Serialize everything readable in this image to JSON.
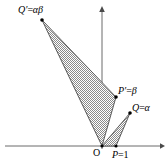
{
  "figure": {
    "background_color": "#ffffff",
    "stroke_color": "#555555",
    "axis_color": "#666666",
    "hatch_color": "#808080",
    "point_color": "#000000"
  },
  "axes": {
    "x_axis": {
      "name": "real-axis",
      "y": 146,
      "x_start": 5,
      "x_end": 162,
      "arrow": "right"
    },
    "y_axis": {
      "name": "imaginary-axis",
      "x": 102,
      "y_start": 148,
      "y_end": 8,
      "arrow": "up"
    }
  },
  "points": {
    "origin": {
      "label": "O",
      "x": 102,
      "y": 146
    },
    "p": {
      "label_name": "P",
      "label_eq": "=",
      "label_value": "1",
      "full": "P=1",
      "x": 116,
      "y": 146
    },
    "q": {
      "label_name": "Q",
      "label_eq": "=",
      "label_value": "α",
      "full": "Q=α",
      "x": 130,
      "y": 113
    },
    "p_prime": {
      "label_name": "P′",
      "label_eq": "=",
      "label_value": "β",
      "full": "P′=β",
      "x": 116,
      "y": 97
    },
    "q_prime": {
      "label_name": "Q′",
      "label_eq": "=",
      "label_value": "αβ",
      "full": "Q′=αβ",
      "x": 42,
      "y": 20
    }
  },
  "triangles": [
    {
      "name": "small-triangle-OPQ",
      "vertices": "102,146 116,146 130,113",
      "fill": "hatched"
    },
    {
      "name": "large-triangle-OP-prime-Q-prime",
      "vertices": "102,146 116,97 42,20",
      "fill": "hatched"
    }
  ],
  "labels": {
    "q_prime": {
      "name": "Q′",
      "eq": "=",
      "value": "αβ"
    },
    "p_prime": {
      "name": "P′",
      "eq": "=",
      "value": "β"
    },
    "q": {
      "name": "Q",
      "eq": "=",
      "value": "α"
    },
    "origin": {
      "text": "O"
    },
    "p": {
      "name": "P",
      "eq": "=",
      "value": "1"
    }
  }
}
